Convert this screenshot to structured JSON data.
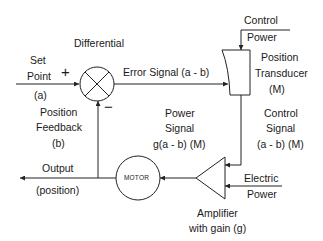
{
  "diagram": {
    "type": "closed-loop position control block diagram",
    "labels": {
      "differential": "Differential",
      "set_point_line1": "Set",
      "set_point_line2": "Point",
      "set_point_var": "(a)",
      "plus_sign": "+",
      "minus_sign": "−",
      "error_signal": "Error Signal (a - b)",
      "control_power_line1": "Control",
      "control_power_line2": "Power",
      "transducer_line1": "Position",
      "transducer_line2": "Transducer",
      "transducer_line3": "(M)",
      "feedback_line1": "Position",
      "feedback_line2": "Feedback",
      "feedback_line3": "(b)",
      "power_signal_line1": "Power",
      "power_signal_line2": "Signal",
      "power_signal_line3": "g(a - b) (M)",
      "control_signal_line1": "Control",
      "control_signal_line2": "Signal",
      "control_signal_line3": "(a - b) (M)",
      "output_line1": "Output",
      "output_line2": "(position)",
      "motor": "MOTOR",
      "electric_power_line1": "Electric",
      "electric_power_line2": "Power",
      "amplifier_line1": "Amplifier",
      "amplifier_line2": "with gain (g)"
    },
    "blocks": [
      {
        "id": "summing-junction",
        "shape": "circle-with-x"
      },
      {
        "id": "position-transducer",
        "shape": "box-with-curved-left-edge"
      },
      {
        "id": "amplifier",
        "shape": "triangle"
      },
      {
        "id": "motor",
        "shape": "circle"
      }
    ],
    "colors": {
      "stroke": "#222222",
      "background": "#ffffff"
    }
  }
}
